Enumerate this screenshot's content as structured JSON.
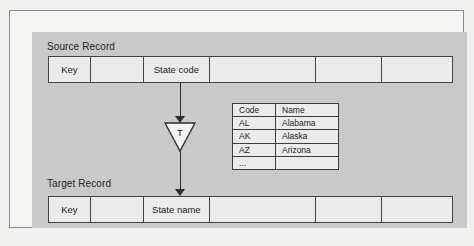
{
  "figure": {
    "type": "data-transformation-diagram",
    "background_color": "#c9c9c9",
    "page_color": "#f1f1f0",
    "line_color": "#2e2e2e"
  },
  "source_record": {
    "label": "Source Record",
    "cells": [
      {
        "text": "Key"
      },
      {
        "text": ""
      },
      {
        "text": "State code"
      },
      {
        "text": ""
      },
      {
        "text": ""
      },
      {
        "text": ""
      }
    ]
  },
  "transform": {
    "label": "T",
    "shape": "down-triangle",
    "inbound_arrow": "down-arrow",
    "outbound_arrow": "down-arrow"
  },
  "lookup_table": {
    "headers": [
      "Code",
      "Name"
    ],
    "rows": [
      [
        "AL",
        "Alabama"
      ],
      [
        "AK",
        "Alaska"
      ],
      [
        "AZ",
        "Arizona"
      ],
      [
        "...",
        ""
      ]
    ]
  },
  "target_record": {
    "label": "Target Record",
    "cells": [
      {
        "text": "Key"
      },
      {
        "text": ""
      },
      {
        "text": "State name"
      },
      {
        "text": ""
      },
      {
        "text": ""
      },
      {
        "text": ""
      }
    ]
  }
}
